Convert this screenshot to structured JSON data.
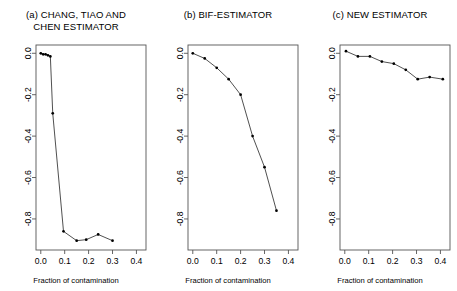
{
  "figure": {
    "background": "#ffffff",
    "line_color": "#3c3c3c",
    "point_color": "#000000",
    "axis_color": "#555555"
  },
  "chart_data": [
    {
      "type": "line",
      "panel_id": "a",
      "title": "(a) CHANG, TIAO AND\nCHEN ESTIMATOR",
      "xlabel": "Fraction of contamination",
      "ylabel": "",
      "xlim": [
        -0.02,
        0.44
      ],
      "ylim": [
        -0.95,
        0.04
      ],
      "xticks": [
        0.0,
        0.1,
        0.2,
        0.3,
        0.4
      ],
      "xticklabels": [
        "0.0",
        "0.1",
        "0.2",
        "0.3",
        "0.4"
      ],
      "yticks": [
        0.0,
        -0.2,
        -0.4,
        -0.6,
        -0.8
      ],
      "yticklabels": [
        "0.0",
        "-0.2",
        "-0.4",
        "-0.6",
        "-0.8"
      ],
      "grid": false,
      "legend": null,
      "markers": true,
      "x": [
        0.0,
        0.01,
        0.02,
        0.03,
        0.04,
        0.05,
        0.095,
        0.15,
        0.19,
        0.24,
        0.3
      ],
      "y": [
        0.0,
        -0.005,
        -0.005,
        -0.01,
        -0.015,
        -0.29,
        -0.86,
        -0.905,
        -0.9,
        -0.875,
        -0.905
      ]
    },
    {
      "type": "line",
      "panel_id": "b",
      "title": "(b) BIF-ESTIMATOR",
      "xlabel": "Fraction of contamination",
      "ylabel": "",
      "xlim": [
        -0.02,
        0.44
      ],
      "ylim": [
        -0.95,
        0.04
      ],
      "xticks": [
        0.0,
        0.1,
        0.2,
        0.3,
        0.4
      ],
      "xticklabels": [
        "0.0",
        "0.1",
        "0.2",
        "0.3",
        "0.4"
      ],
      "yticks": [
        0.0,
        -0.2,
        -0.4,
        -0.6,
        -0.8
      ],
      "yticklabels": [
        "0.0",
        "-0.2",
        "-0.4",
        "-0.6",
        "-0.8"
      ],
      "grid": false,
      "legend": null,
      "markers": true,
      "x": [
        0.0,
        0.05,
        0.1,
        0.15,
        0.2,
        0.25,
        0.3,
        0.35
      ],
      "y": [
        0.0,
        -0.025,
        -0.07,
        -0.125,
        -0.2,
        -0.4,
        -0.55,
        -0.76
      ]
    },
    {
      "type": "line",
      "panel_id": "c",
      "title": "(c) NEW ESTIMATOR",
      "xlabel": "Fraction of contamination",
      "ylabel": "",
      "xlim": [
        -0.02,
        0.44
      ],
      "ylim": [
        -0.95,
        0.04
      ],
      "xticks": [
        0.0,
        0.1,
        0.2,
        0.3,
        0.4
      ],
      "xticklabels": [
        "0.0",
        "0.1",
        "0.2",
        "0.3",
        "0.4"
      ],
      "yticks": [
        0.0,
        -0.2,
        -0.4,
        -0.6,
        -0.8
      ],
      "yticklabels": [
        "0.0",
        "-0.2",
        "-0.4",
        "-0.6",
        "-0.8"
      ],
      "grid": false,
      "legend": null,
      "markers": true,
      "x": [
        0.005,
        0.055,
        0.105,
        0.155,
        0.205,
        0.255,
        0.305,
        0.355,
        0.41
      ],
      "y": [
        0.01,
        -0.015,
        -0.015,
        -0.04,
        -0.05,
        -0.08,
        -0.125,
        -0.115,
        -0.125
      ]
    }
  ]
}
